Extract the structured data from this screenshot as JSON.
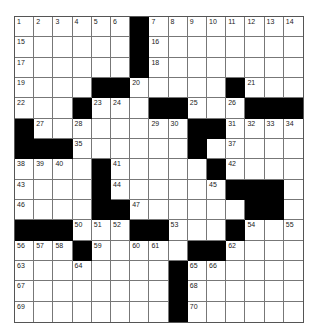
{
  "puzzle": {
    "rows": 15,
    "cols": 15,
    "layout": [
      "......#........",
      "......#........",
      "......#........",
      "....##.....#...",
      "...#...##...###",
      "#........##....",
      "###......#.....",
      "....#.....#....",
      "....#......###.",
      "....##......##.",
      "###...##...#...",
      "...#.....##....",
      "........#......",
      "........#......",
      "........#......"
    ],
    "numbers": [
      [
        1,
        2,
        3,
        4,
        5,
        6,
        null,
        7,
        8,
        9,
        10,
        11,
        12,
        13,
        14
      ],
      [
        15,
        null,
        null,
        null,
        null,
        null,
        null,
        16,
        null,
        null,
        null,
        null,
        null,
        null,
        null
      ],
      [
        17,
        null,
        null,
        null,
        null,
        null,
        null,
        18,
        null,
        null,
        null,
        null,
        null,
        null,
        null
      ],
      [
        19,
        null,
        null,
        null,
        null,
        null,
        20,
        null,
        null,
        null,
        null,
        null,
        21,
        null,
        null
      ],
      [
        22,
        null,
        null,
        null,
        23,
        24,
        null,
        null,
        null,
        25,
        null,
        26,
        null,
        null,
        null
      ],
      [
        null,
        27,
        null,
        28,
        null,
        null,
        null,
        29,
        30,
        null,
        null,
        31,
        32,
        33,
        34
      ],
      [
        null,
        null,
        null,
        35,
        null,
        null,
        null,
        null,
        null,
        36,
        null,
        37,
        null,
        null,
        null
      ],
      [
        38,
        39,
        40,
        null,
        null,
        41,
        null,
        null,
        null,
        null,
        null,
        42,
        null,
        null,
        null
      ],
      [
        43,
        null,
        null,
        null,
        null,
        44,
        null,
        null,
        null,
        null,
        45,
        null,
        null,
        null,
        null
      ],
      [
        46,
        null,
        null,
        null,
        null,
        null,
        47,
        null,
        null,
        null,
        null,
        null,
        48,
        49,
        null
      ],
      [
        null,
        null,
        null,
        50,
        51,
        52,
        null,
        null,
        53,
        null,
        null,
        null,
        54,
        null,
        55
      ],
      [
        56,
        57,
        58,
        null,
        59,
        null,
        60,
        61,
        null,
        null,
        null,
        62,
        null,
        null,
        null
      ],
      [
        63,
        null,
        null,
        64,
        null,
        null,
        null,
        null,
        null,
        65,
        66,
        null,
        null,
        null,
        null
      ],
      [
        67,
        null,
        null,
        null,
        null,
        null,
        null,
        null,
        null,
        68,
        null,
        null,
        null,
        null,
        null
      ],
      [
        69,
        null,
        null,
        null,
        null,
        null,
        null,
        null,
        null,
        70,
        null,
        null,
        null,
        null,
        null
      ]
    ]
  }
}
